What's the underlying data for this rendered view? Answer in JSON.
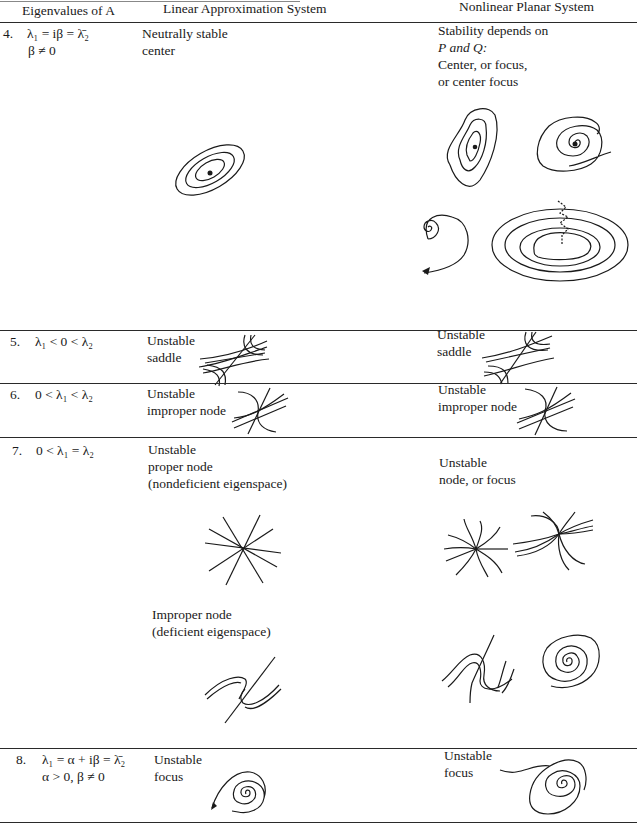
{
  "header": {
    "col1": "Eigenvalues of A",
    "col2": "Linear Approximation System",
    "col3": "Nonlinear Planar System"
  },
  "rows": [
    {
      "number": "4.",
      "eigen_line1": "λ₁ = iβ = λ̄₂",
      "eigen_line2": "β ≠ 0",
      "linear_lines": [
        "Neutrally stable",
        "center"
      ],
      "nonlinear_lines": [
        "Stability depends on",
        "P and Q:",
        "Center, or focus,",
        "or center focus"
      ],
      "linear_figure": "center-icon",
      "nonlinear_figures": [
        "center-distorted-icon",
        "focus-spiral-icon",
        "spiral-outward-icon",
        "center-focus-icon"
      ]
    },
    {
      "number": "5.",
      "eigen_line1": "λ₁ < 0 < λ₂",
      "linear_lines": [
        "Unstable",
        "saddle"
      ],
      "nonlinear_lines": [
        "Unstable",
        "saddle"
      ],
      "linear_figure": "saddle-icon",
      "nonlinear_figures": [
        "saddle-icon"
      ]
    },
    {
      "number": "6.",
      "eigen_line1": "0 < λ₁ < λ₂",
      "linear_lines": [
        "Unstable",
        "improper node"
      ],
      "nonlinear_lines": [
        "Unstable",
        "improper node"
      ],
      "linear_figure": "improper-node-icon",
      "nonlinear_figures": [
        "improper-node-icon"
      ]
    },
    {
      "number": "7.",
      "eigen_line1": "0 < λ₁ = λ₂",
      "linear_lines": [
        "Unstable",
        "proper node",
        "(nondeficient eigenspace)"
      ],
      "linear_lines_b": [
        "Improper node",
        "(deficient eigenspace)"
      ],
      "nonlinear_lines": [
        "Unstable",
        "node, or focus"
      ],
      "linear_figure": "proper-node-star-icon",
      "linear_figure_b": "improper-node-deficient-icon",
      "nonlinear_figures": [
        "curved-star-node-icon",
        "curved-improper-node-icon",
        "s-curve-node-icon",
        "spiral-focus-icon"
      ]
    },
    {
      "number": "8.",
      "eigen_line1": "λ₁ = α + iβ = λ̄₂",
      "eigen_line2": "α > 0, β ≠ 0",
      "linear_lines": [
        "Unstable",
        "focus"
      ],
      "nonlinear_lines": [
        "Unstable",
        "focus"
      ],
      "linear_figure": "unstable-focus-spiral-icon",
      "nonlinear_figures": [
        "unstable-focus-spiral-icon"
      ]
    }
  ]
}
